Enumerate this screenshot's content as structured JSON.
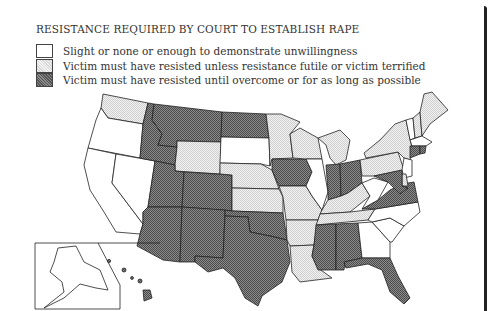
{
  "title": "RESISTANCE REQUIRED BY COURT TO ESTABLISH RAPE",
  "legend": [
    {
      "key": "white",
      "label": "Slight or none or enough to demonstrate unwillingness"
    },
    {
      "key": "light",
      "label": "Victim must have resisted unless resistance futile or victim terrified"
    },
    {
      "key": "dark",
      "label": "Victim must have resisted until overcome or for as long as possible"
    }
  ],
  "colors": {
    "white": "#ffffff",
    "light": "#e6e6e6",
    "dark": "#6e6e6e",
    "stroke": "#222222"
  },
  "states": {
    "WA": "light",
    "OR": "white",
    "CA": "white",
    "NV": "white",
    "ID": "dark",
    "MT": "dark",
    "WY": "light",
    "UT": "dark",
    "CO": "dark",
    "AZ": "dark",
    "NM": "dark",
    "ND": "dark",
    "SD": "white",
    "NE": "light",
    "KS": "light",
    "OK": "dark",
    "TX": "dark",
    "MN": "light",
    "IA": "dark",
    "MO": "light",
    "AR": "light",
    "LA": "light",
    "WI": "light",
    "IL": "white",
    "MI": "light",
    "IN": "dark",
    "OH": "dark",
    "KY": "light",
    "TN": "light",
    "MS": "dark",
    "AL": "dark",
    "GA": "white",
    "FL": "dark",
    "SC": "white",
    "NC": "white",
    "VA": "dark",
    "WV": "white",
    "PA": "light",
    "NY": "light",
    "VT": "white",
    "NH": "light",
    "ME": "light",
    "MA": "white",
    "RI": "dark",
    "CT": "dark",
    "NJ": "white",
    "DE": "light",
    "MD": "dark",
    "AK": "white",
    "HI": "dark"
  }
}
